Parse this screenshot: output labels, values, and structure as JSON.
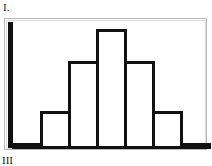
{
  "labels": {
    "top": "I.",
    "bottom": "III"
  },
  "chart_data": {
    "type": "bar",
    "title": "",
    "xlabel": "",
    "ylabel": "",
    "categories": [
      "1",
      "2",
      "3",
      "4",
      "5",
      "6",
      "7"
    ],
    "values": [
      1,
      6,
      14,
      19,
      14,
      6,
      1
    ],
    "ylim": [
      0,
      20
    ],
    "grid": false,
    "legend": null
  },
  "colors": {
    "bar_stroke": "#111111",
    "bar_fill": "#ffffff",
    "frame": "#b8b8b8"
  }
}
